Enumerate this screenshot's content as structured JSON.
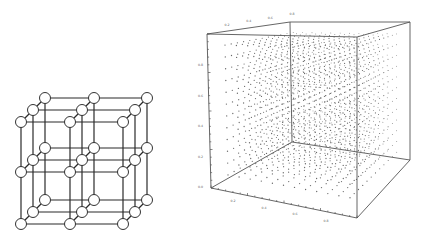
{
  "figure": {
    "left_panel": {
      "name": "simple-cubic-lattice-3x3x3",
      "description": "3x3x3 lattice of open circles connected by lines",
      "node_radius": 5.5,
      "depth_offsets": [
        [
          0,
          0
        ],
        [
          12,
          -12
        ],
        [
          24,
          -24
        ]
      ],
      "front_x": [
        21,
        70,
        123
      ],
      "front_y": [
        122,
        172,
        224
      ],
      "colors": {
        "edge": "#2a2a2a",
        "node_fill": "#ffffff",
        "node_stroke": "#333333"
      }
    },
    "right_panel": {
      "name": "3d-point-grid-cube",
      "description": "3D bounding box filled with a regular grid of points",
      "vertices": {
        "front_top_left": [
          207,
          34
        ],
        "front_top_right": [
          357,
          37
        ],
        "front_bottom_left": [
          211,
          188
        ],
        "front_bottom_right": [
          357,
          218
        ],
        "back_top_left": [
          290,
          22
        ],
        "back_top_right": [
          410,
          22
        ],
        "back_bottom_left": [
          292,
          142
        ],
        "back_bottom_right": [
          410,
          160
        ]
      },
      "grid_size": 13,
      "colors": {
        "edge": "#555555",
        "dot": "#6a6a6a"
      },
      "axes": {
        "top_tick_labels": [
          "0.2",
          "0.4",
          "0.6",
          "0.8"
        ],
        "left_tick_labels": [
          "0.8",
          "0.6",
          "0.4",
          "0.2",
          "0.0"
        ],
        "bottom_tick_labels": [
          "0.2",
          "0.4",
          "0.6",
          "0.8"
        ]
      }
    }
  }
}
